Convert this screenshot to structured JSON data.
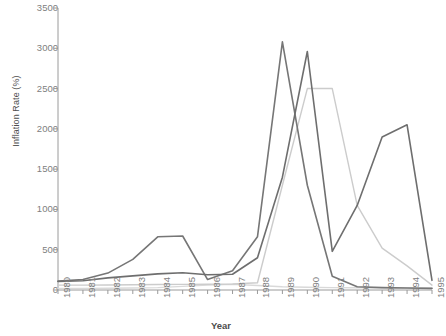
{
  "chart_data": {
    "type": "line",
    "title": "",
    "xlabel": "Year",
    "ylabel": "Inflation Rate (%)",
    "categories": [
      1980,
      1981,
      1982,
      1983,
      1984,
      1985,
      1986,
      1987,
      1988,
      1989,
      1990,
      1991,
      1992,
      1993,
      1994,
      1995
    ],
    "xlim": [
      1980,
      1995
    ],
    "ylim": [
      0,
      3500
    ],
    "yticks": [
      0,
      500,
      1000,
      1500,
      2000,
      2500,
      3000,
      3500
    ],
    "ytick_labels": [
      "0",
      "500",
      "1000",
      "1500",
      "2000",
      "2500",
      "3000",
      "3500"
    ],
    "xtick_labels": [
      "1980",
      "1981",
      "1982",
      "1983",
      "1984",
      "1985",
      "1986",
      "1987",
      "1988",
      "1989",
      "1990",
      "1991",
      "1992",
      "1993",
      "1994",
      "1995"
    ],
    "grid": false,
    "legend": "none",
    "series": [
      {
        "name": "series-1",
        "color": "#767676",
        "width": 1.6,
        "values": [
          110,
          130,
          210,
          380,
          660,
          670,
          130,
          240,
          660,
          3080,
          1300,
          170,
          40,
          30,
          25,
          20
        ]
      },
      {
        "name": "series-2",
        "color": "#6e6e6e",
        "width": 1.6,
        "values": [
          105,
          115,
          150,
          175,
          200,
          215,
          190,
          195,
          400,
          1400,
          2960,
          480,
          1050,
          1900,
          2050,
          120
        ]
      },
      {
        "name": "series-3",
        "color": "#cccccc",
        "width": 1.4,
        "values": [
          60,
          60,
          62,
          65,
          68,
          70,
          72,
          75,
          90,
          1300,
          2500,
          2500,
          1050,
          520,
          300,
          60
        ]
      },
      {
        "name": "series-4",
        "color": "#d9d9d9",
        "width": 1.4,
        "values": [
          20,
          20,
          22,
          25,
          30,
          45,
          60,
          70,
          55,
          40,
          35,
          30,
          28,
          26,
          24,
          22
        ]
      }
    ]
  }
}
